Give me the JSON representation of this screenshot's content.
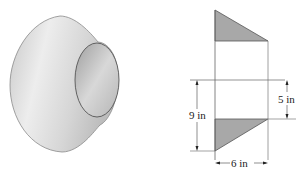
{
  "figure": {
    "left_panel": {
      "description": "3D rendering of a hollow truncated cone (frustum shell)",
      "fill_light": "#e9e9e9",
      "fill_dark": "#bdbdbd",
      "outline": "#7a7a7a"
    },
    "right_panel": {
      "description": "Cross-section of the solid of revolution with dimensions",
      "shade_color": "#a8a8a8",
      "line_color": "#555555",
      "dimensions": {
        "height_total": "9 in",
        "height_axis_offset": "5 in",
        "width": "6 in"
      }
    }
  }
}
